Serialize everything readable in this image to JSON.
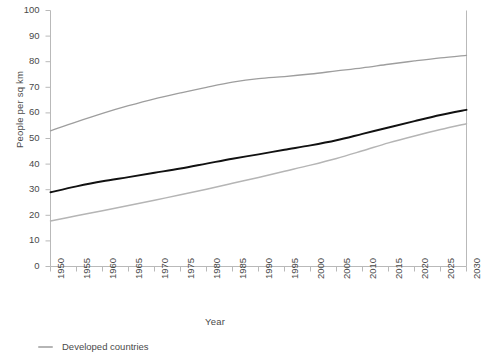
{
  "chart_data": {
    "type": "line",
    "title": "",
    "subtitle": "",
    "xlabel": "Year",
    "ylabel": "People per sq km",
    "xlim": [
      1950,
      2030
    ],
    "ylim": [
      0,
      100
    ],
    "grid": false,
    "legend_position": "bottom-left",
    "x": [
      1950,
      1955,
      1960,
      1965,
      1970,
      1975,
      1980,
      1985,
      1990,
      1995,
      2000,
      2005,
      2010,
      2015,
      2020,
      2025,
      2030
    ],
    "xticks": [
      "1950",
      "1955",
      "1960",
      "1965",
      "1970",
      "1975",
      "1980",
      "1985",
      "1990",
      "1995",
      "2000",
      "2005",
      "2010",
      "2015",
      "2020",
      "2025",
      "2030"
    ],
    "yticks": [
      "0",
      "10",
      "20",
      "30",
      "40",
      "50",
      "60",
      "70",
      "80",
      "90",
      "100"
    ],
    "series": [
      {
        "name": "upper-line",
        "color": "#9e9e9e",
        "width": 1.3,
        "values": [
          53.0,
          56.5,
          59.8,
          62.8,
          65.5,
          67.8,
          70.0,
          72.0,
          73.4,
          74.2,
          75.2,
          76.4,
          77.6,
          79.0,
          80.3,
          81.5,
          82.5
        ]
      },
      {
        "name": "middle-line",
        "color": "#111111",
        "width": 1.9,
        "values": [
          29.0,
          31.3,
          33.3,
          34.9,
          36.6,
          38.3,
          40.2,
          42.1,
          43.8,
          45.6,
          47.3,
          49.3,
          51.8,
          54.3,
          56.8,
          59.2,
          61.2
        ]
      },
      {
        "name": "lower-line",
        "color": "#b5b5b5",
        "width": 1.5,
        "values": [
          17.8,
          19.8,
          21.8,
          23.8,
          25.9,
          28.0,
          30.2,
          32.5,
          34.8,
          37.2,
          39.6,
          42.2,
          45.2,
          48.3,
          51.0,
          53.5,
          55.8
        ]
      }
    ],
    "legend": [
      {
        "label": "Developed countries",
        "color": "#b5b5b5"
      }
    ]
  }
}
